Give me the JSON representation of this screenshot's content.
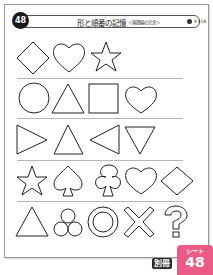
{
  "header": {
    "number": "48",
    "title": "形と順番の記憶",
    "subtitle": "＜基礎編の完全＞",
    "page_ref": "P.118"
  },
  "rows": [
    {
      "shapes": [
        "diamond",
        "heart",
        "star"
      ]
    },
    {
      "shapes": [
        "circle",
        "triangle-up",
        "square",
        "heart"
      ]
    },
    {
      "shapes": [
        "triangle-right",
        "triangle-up",
        "triangle-left",
        "triangle-down"
      ]
    },
    {
      "shapes": [
        "star",
        "spade",
        "club",
        "heart",
        "diamond"
      ]
    },
    {
      "shapes": [
        "triangle-up",
        "three-circles",
        "double-circle",
        "cross",
        "question-mark"
      ]
    }
  ],
  "tag": {
    "label": "シート",
    "number": "48",
    "bessatsu": "別冊",
    "color": "#ec5a86"
  }
}
